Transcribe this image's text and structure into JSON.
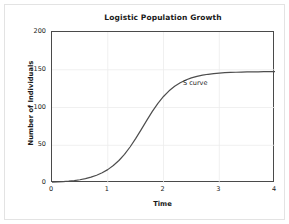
{
  "chart_data": {
    "type": "line",
    "title": "Logistic Population Growth",
    "xlabel": "Time",
    "ylabel": "Number of Individuals",
    "xlim": [
      0,
      4
    ],
    "ylim": [
      0,
      200
    ],
    "xticks": [
      "0",
      "1",
      "2",
      "3",
      "4"
    ],
    "xtick_values": [
      0,
      1,
      2,
      3,
      4
    ],
    "yticks": [
      "0",
      "50",
      "100",
      "150",
      "200"
    ],
    "ytick_values": [
      0,
      50,
      100,
      150,
      200
    ],
    "grid": true,
    "legend": "none",
    "carrying_capacity": 150,
    "curve_color": "#4d4d4d",
    "grid_color": "#e8e8e8",
    "axis_color": "#4a4a4a",
    "background_color": "#ffffff",
    "annotations": [
      {
        "text": "S curve",
        "x": 2.35,
        "y": 132
      }
    ],
    "series": [
      {
        "name": "Logistic growth",
        "x": [
          0,
          0.1,
          0.2,
          0.3,
          0.4,
          0.5,
          0.6,
          0.7,
          0.8,
          0.9,
          1.0,
          1.1,
          1.2,
          1.3,
          1.4,
          1.5,
          1.6,
          1.7,
          1.8,
          1.9,
          2.0,
          2.1,
          2.2,
          2.3,
          2.4,
          2.5,
          2.6,
          2.7,
          2.8,
          2.9,
          3.0,
          3.1,
          3.2,
          3.3,
          3.4,
          3.5,
          3.6,
          3.7,
          3.8,
          3.9,
          4.0
        ],
        "values": [
          1.0,
          1.3,
          1.8,
          2.4,
          3.2,
          4.3,
          5.8,
          7.7,
          10.2,
          13.5,
          17.7,
          23.1,
          29.8,
          38.0,
          47.7,
          58.7,
          70.7,
          83.0,
          94.8,
          105.5,
          114.6,
          122.1,
          128.1,
          132.8,
          136.4,
          139.2,
          141.3,
          142.8,
          144.0,
          144.9,
          145.6,
          146.1,
          146.4,
          146.7,
          146.9,
          147.1,
          147.2,
          147.3,
          147.4,
          147.4,
          147.5
        ]
      }
    ]
  }
}
